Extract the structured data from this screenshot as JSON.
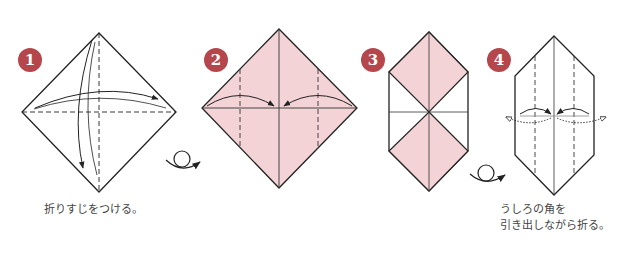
{
  "steps": [
    {
      "number": "1",
      "caption": "折りすじをつける。"
    },
    {
      "number": "2",
      "caption": ""
    },
    {
      "number": "3",
      "caption": ""
    },
    {
      "number": "4",
      "caption_line1": "うしろの角を",
      "caption_line2": "引き出しながら折る。"
    }
  ],
  "colors": {
    "badge": "#b5464c",
    "paper": "#f3d3d5",
    "line": "#222222"
  },
  "icons": [
    "turn-over-icon",
    "turn-over-icon"
  ]
}
